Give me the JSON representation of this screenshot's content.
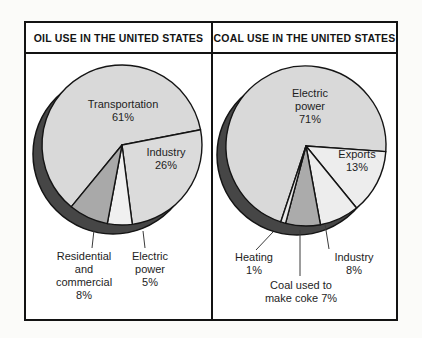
{
  "panels": [
    {
      "title": "OIL USE IN THE UNITED STATES",
      "labels": {
        "transportation": "Transportation\n61%",
        "industry": "Industry\n26%",
        "electric_power": "Electric\npower\n5%",
        "residential": "Residential\nand\ncommercial\n8%"
      }
    },
    {
      "title": "COAL USE IN THE UNITED STATES",
      "labels": {
        "electric_power": "Electric\npower\n71%",
        "exports": "Exports\n13%",
        "heating": "Heating\n1%",
        "industry": "Industry 8%",
        "coke": "Coal used to\nmake coke 7%"
      }
    }
  ],
  "chart_data": [
    {
      "type": "pie",
      "title": "OIL USE IN THE UNITED STATES",
      "units": "percent of total oil use",
      "slice_order": "clockwise from start_angle_deg",
      "start_angle_deg": 230.6,
      "slices": [
        {
          "label": "Transportation",
          "pct": 61,
          "color": "#d9d9d9"
        },
        {
          "label": "Industry",
          "pct": 26,
          "color": "#dbdbdb"
        },
        {
          "label": "Electric power",
          "pct": 5,
          "color": "#f0f0f0"
        },
        {
          "label": "Residential and commercial",
          "pct": 8,
          "color": "#a9a9a9"
        }
      ],
      "shadow_color": "#464646",
      "outline_color": "#141414",
      "legend": "labels placed on/around slices with leader lines"
    },
    {
      "type": "pie",
      "title": "COAL USE IN THE UNITED STATES",
      "units": "percent of total coal use",
      "slice_order": "clockwise from start_angle_deg",
      "start_angle_deg": 251.6,
      "slices": [
        {
          "label": "Electric power",
          "pct": 71,
          "color": "#d9d9d9"
        },
        {
          "label": "Exports",
          "pct": 13,
          "color": "#ededed"
        },
        {
          "label": "Industry",
          "pct": 8,
          "color": "#ededed"
        },
        {
          "label": "Coal used to make coke",
          "pct": 7,
          "color": "#ababab"
        },
        {
          "label": "Heating",
          "pct": 1,
          "color": "#e7e7e7"
        }
      ],
      "shadow_color": "#464646",
      "outline_color": "#141414",
      "legend": "labels placed on/around slices with leader lines"
    }
  ]
}
